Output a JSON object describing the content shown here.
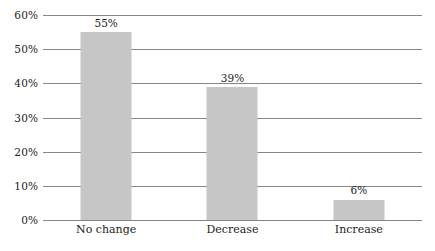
{
  "chart_data": {
    "type": "bar",
    "title": "",
    "subtitle": "",
    "xlabel": "",
    "ylabel": "",
    "categories": [
      "No change",
      "Decrease",
      "Increase"
    ],
    "values": [
      55,
      39,
      6
    ],
    "value_labels": [
      "55%",
      "39%",
      "6%"
    ],
    "ylim": [
      0,
      60
    ],
    "ytick_values": [
      0,
      10,
      20,
      30,
      40,
      50,
      60
    ],
    "ytick_labels": [
      "0%",
      "10%",
      "20%",
      "30%",
      "40%",
      "50%",
      "60%"
    ],
    "grid": true,
    "grid_axis": "y",
    "legend": false,
    "legend_position": "none",
    "orientation": "vertical",
    "series": [
      {
        "name": "",
        "values": [
          55,
          39,
          6
        ]
      }
    ]
  },
  "style": {
    "bar_color": "#c6c6c6",
    "gridline_color": "#868686",
    "text_color": "#1c1c1c",
    "background_color": "#ffffff"
  }
}
